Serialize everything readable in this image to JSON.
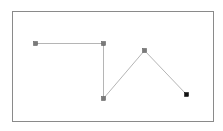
{
  "canvas": {
    "width": 223,
    "height": 131,
    "background": "#ffffff",
    "frame": {
      "x": 12,
      "y": 11,
      "width": 201,
      "height": 110,
      "stroke": "#8a8a8a"
    }
  },
  "polyline": {
    "stroke": "#b5b5b5",
    "points": [
      {
        "x": 35,
        "y": 43,
        "fill": "#7a7a7a",
        "stroke": "#555555"
      },
      {
        "x": 103,
        "y": 43,
        "fill": "#7a7a7a",
        "stroke": "#555555"
      },
      {
        "x": 103,
        "y": 98,
        "fill": "#7a7a7a",
        "stroke": "#555555"
      },
      {
        "x": 144,
        "y": 50,
        "fill": "#7a7a7a",
        "stroke": "#555555"
      },
      {
        "x": 186,
        "y": 94,
        "fill": "#111111",
        "stroke": "#000000"
      }
    ]
  }
}
